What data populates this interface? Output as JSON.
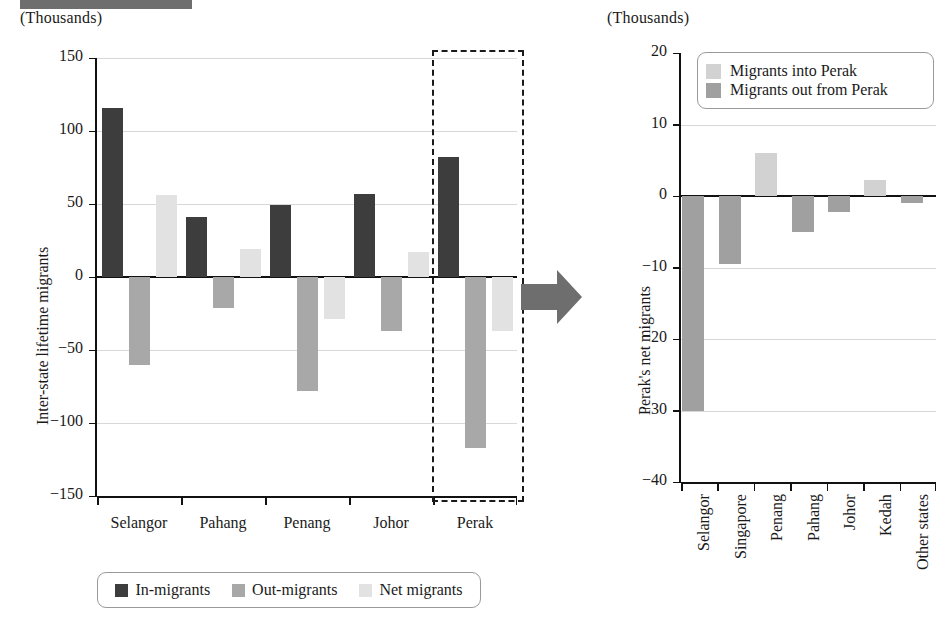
{
  "page": {
    "units_label_left": "(Thousands)",
    "units_label_right": "(Thousands)"
  },
  "left_panel": {
    "y_axis_title": "Inter-state lifetime migrants",
    "legend": [
      {
        "label": "In-migrants",
        "color": "#3d3d3d"
      },
      {
        "label": "Out-migrants",
        "color": "#a8a8a8"
      },
      {
        "label": "Net migrants",
        "color": "#e2e2e2"
      }
    ]
  },
  "right_panel": {
    "y_axis_title": "Perak's net migrants",
    "legend": [
      {
        "label": "Migrants into Perak",
        "color": "#d2d2d2"
      },
      {
        "label": "Migrants out from Perak",
        "color": "#a0a0a0"
      }
    ]
  },
  "arrow": {
    "name": "flow-arrow",
    "color": "#6e6e6e"
  },
  "highlight": {
    "name": "perak-highlight-box",
    "state": "Perak"
  },
  "chart_data": [
    {
      "type": "bar",
      "id": "inter-state-lifetime-migrants",
      "title": "",
      "xlabel": "",
      "ylabel": "Inter-state lifetime migrants",
      "units": "(Thousands)",
      "ylim": [
        -150,
        150
      ],
      "yticks": [
        150,
        100,
        50,
        0,
        -50,
        -100,
        -150
      ],
      "ytick_labels": [
        "150",
        "100",
        "50",
        "0",
        "−50",
        "−100",
        "−150"
      ],
      "grid": true,
      "legend_position": "bottom",
      "categories": [
        "Selangor",
        "Pahang",
        "Penang",
        "Johor",
        "Perak"
      ],
      "series": [
        {
          "name": "In-migrants",
          "color": "#3d3d3d",
          "values": [
            116,
            41,
            49,
            57,
            82
          ]
        },
        {
          "name": "Out-migrants",
          "color": "#a8a8a8",
          "values": [
            -60,
            -21,
            -78,
            -37,
            -117
          ]
        },
        {
          "name": "Net migrants",
          "color": "#e2e2e2",
          "values": [
            56,
            19,
            -29,
            17,
            -37
          ]
        }
      ]
    },
    {
      "type": "bar",
      "id": "perak-net-migrants",
      "title": "",
      "xlabel": "",
      "ylabel": "Perak's net migrants",
      "units": "(Thousands)",
      "ylim": [
        -40,
        20
      ],
      "yticks": [
        20,
        10,
        0,
        -10,
        -20,
        -30,
        -40
      ],
      "ytick_labels": [
        "20",
        "10",
        "0",
        "−10",
        "−20",
        "−30",
        "−40"
      ],
      "grid": true,
      "legend_position": "top-right",
      "categories": [
        "Selangor",
        "Singapore",
        "Penang",
        "Pahang",
        "Johor",
        "Kedah",
        "Other states"
      ],
      "values": [
        -30,
        -9.5,
        6,
        -5,
        -2.3,
        2.3,
        -1
      ],
      "bar_colors": [
        "#a0a0a0",
        "#a0a0a0",
        "#d2d2d2",
        "#a0a0a0",
        "#a0a0a0",
        "#d2d2d2",
        "#a0a0a0"
      ]
    }
  ]
}
